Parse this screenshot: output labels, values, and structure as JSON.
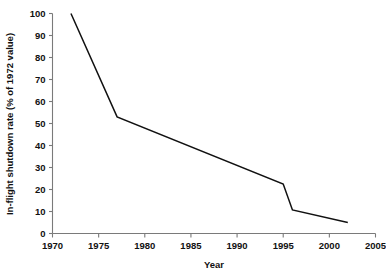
{
  "chart_data": {
    "type": "line",
    "title": "",
    "xlabel": "Year",
    "ylabel": "In-flight shutdown rate (% of 1972 value)",
    "xlim": [
      1970,
      2005
    ],
    "ylim": [
      0,
      100
    ],
    "xticks": [
      1970,
      1975,
      1980,
      1985,
      1990,
      1995,
      2000,
      2005
    ],
    "xtick_labels": [
      "1970",
      "1975",
      "1980",
      "1985",
      "1990",
      "1995",
      "2000",
      "2005"
    ],
    "yticks": [
      0,
      10,
      20,
      30,
      40,
      50,
      60,
      70,
      80,
      90,
      100
    ],
    "ytick_labels": [
      "0",
      "10",
      "20",
      "30",
      "40",
      "50",
      "60",
      "70",
      "80",
      "90",
      "100"
    ],
    "grid": false,
    "legend": false,
    "legend_position": "none",
    "series": [
      {
        "name": "In-flight shutdown rate",
        "color": "#111111",
        "x": [
          1972,
          1977,
          1995,
          1996,
          2002
        ],
        "values": [
          100,
          53,
          22.5,
          10.7,
          5
        ]
      }
    ]
  },
  "axes": {
    "x_axis_label": "Year",
    "y_axis_label": "In-flight shutdown rate (% of 1972 value)",
    "x_min_label": "1970",
    "x_max_label": "2005",
    "y_min_label": "0",
    "y_max_label": "100",
    "axis_color": "#7a7a7a",
    "line_color": "#111111"
  }
}
